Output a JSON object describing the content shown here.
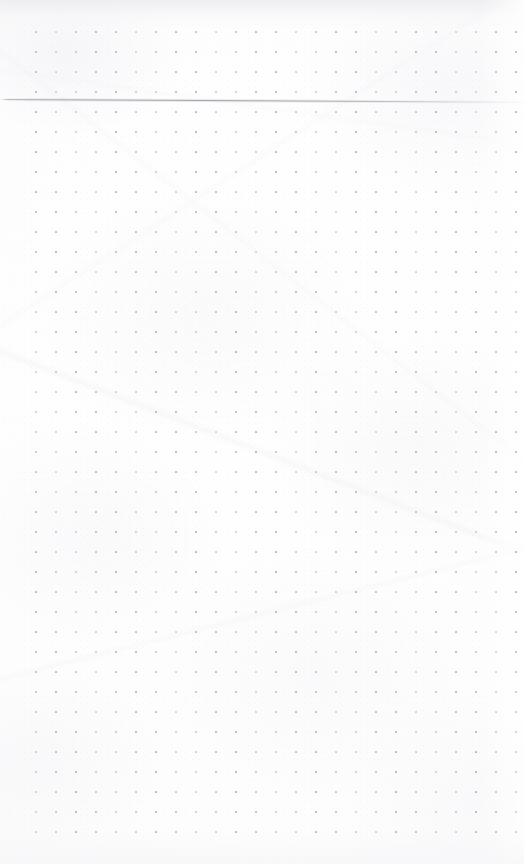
{
  "page": {
    "kind": "dot-grid-notebook-page",
    "width": 524,
    "height": 864,
    "background_color": "#fdfdfd",
    "text_content": "",
    "annotations": []
  },
  "dot_grid": {
    "dot_color": "#b9b9c0",
    "dot_size_px": 2,
    "spacing_px": 20,
    "origin_x": 36,
    "origin_y": 32,
    "columns": 25,
    "rows": 41,
    "margin_left_px": 36,
    "margin_top_px": 32,
    "margin_right_px": 8,
    "margin_bottom_px": 32
  },
  "rule_line": {
    "label": "horizontal-rule",
    "y_left_px": 99,
    "y_right_px": 102,
    "x_start_px": 0,
    "x_end_px": 524,
    "thickness_px": 1,
    "color": "#a0a0a8",
    "tilt_degrees": 0.3,
    "fades_toward": "right"
  },
  "paper": {
    "tone": "#fdfdfe",
    "edge_shade_color": "#e9e9ed",
    "texture": "subtle fiber grain with faint diagonal creases"
  }
}
